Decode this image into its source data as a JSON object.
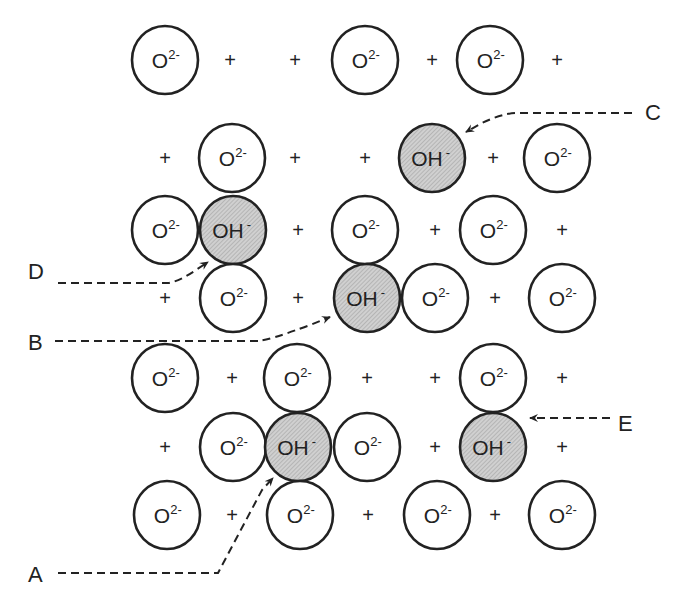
{
  "diagram": {
    "type": "crystal-lattice-ion-arrangement",
    "colors": {
      "stroke": "#222222",
      "oh_fill": "#c8c8c8",
      "background": "#ffffff"
    },
    "ion_labels": {
      "oxide": "O",
      "oxide_charge": "2-",
      "hydroxide": "OH",
      "hydroxide_charge": "-",
      "cation": "+"
    },
    "rows": [
      {
        "y": 60,
        "items": [
          [
            "O",
            165
          ],
          [
            "+",
            230
          ],
          [
            "+",
            295
          ],
          [
            "O",
            365
          ],
          [
            "+",
            432
          ],
          [
            "O",
            490
          ],
          [
            "+",
            557
          ]
        ]
      },
      {
        "y": 158,
        "items": [
          [
            "+",
            165
          ],
          [
            "O",
            232
          ],
          [
            "+",
            295
          ],
          [
            "+",
            365
          ],
          [
            "OH",
            432
          ],
          [
            "+",
            493
          ],
          [
            "O",
            557
          ]
        ]
      },
      {
        "y": 230,
        "items": [
          [
            "O",
            165
          ],
          [
            "OH",
            233
          ],
          [
            "+",
            298
          ],
          [
            "O",
            365
          ],
          [
            "+",
            435
          ],
          [
            "O",
            493
          ],
          [
            "+",
            562
          ]
        ]
      },
      {
        "y": 298,
        "items": [
          [
            "+",
            165
          ],
          [
            "O",
            233
          ],
          [
            "+",
            298
          ],
          [
            "OH",
            367
          ],
          [
            "O",
            435
          ],
          [
            "+",
            495
          ],
          [
            "O",
            562
          ]
        ]
      },
      {
        "y": 378,
        "items": [
          [
            "O",
            165
          ],
          [
            "+",
            232
          ],
          [
            "O",
            297
          ],
          [
            "+",
            367
          ],
          [
            "+",
            435
          ],
          [
            "O",
            493
          ],
          [
            "+",
            562
          ]
        ]
      },
      {
        "y": 447,
        "items": [
          [
            "+",
            165
          ],
          [
            "O",
            233
          ],
          [
            "OH",
            298
          ],
          [
            "O",
            367
          ],
          [
            "+",
            435
          ],
          [
            "OH",
            493
          ],
          [
            "+",
            562
          ]
        ]
      },
      {
        "y": 515,
        "items": [
          [
            "O",
            167
          ],
          [
            "+",
            232
          ],
          [
            "O",
            300
          ],
          [
            "+",
            368
          ],
          [
            "O",
            437
          ],
          [
            "+",
            495
          ],
          [
            "O",
            562
          ]
        ]
      }
    ],
    "callouts": [
      {
        "label": "C",
        "x": 645,
        "y": 120,
        "path": "M 632 113 L 515 113 Q 500 114 480 124 L 466 132"
      },
      {
        "label": "D",
        "x": 28,
        "y": 279,
        "path": "M 58 283 L 168 283 Q 178 282 196 270 L 208 262"
      },
      {
        "label": "B",
        "x": 28,
        "y": 350,
        "path": "M 55 341 L 258 341 Q 270 340 310 325 L 330 317"
      },
      {
        "label": "E",
        "x": 618,
        "y": 431,
        "path": "M 610 418 L 530 418"
      },
      {
        "label": "A",
        "x": 28,
        "y": 582,
        "path": "M 58 573 L 218 573 L 262 490 L 273 478"
      }
    ]
  }
}
